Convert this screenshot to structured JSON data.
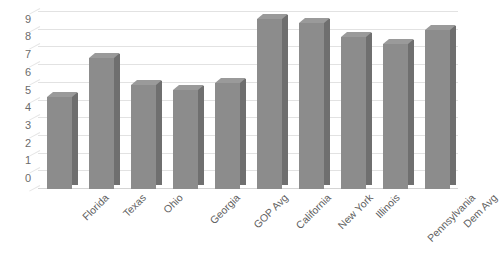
{
  "chart_data": {
    "type": "bar",
    "title": "",
    "subtitle": "",
    "xlabel": "",
    "ylabel": "",
    "categories": [
      "Florida",
      "Texas",
      "Ohio",
      "Georgia",
      "GOP Avg",
      "California",
      "New York",
      "Illinois",
      "Pennsylvania",
      "Dem Avg"
    ],
    "values": [
      5.2,
      7.4,
      5.9,
      5.6,
      6.0,
      9.6,
      9.4,
      8.6,
      8.2,
      9.0
    ],
    "ylim": [
      0,
      10
    ],
    "ytick_labels": [
      "0",
      "1",
      "2",
      "3",
      "4",
      "5",
      "6",
      "7",
      "8",
      "9"
    ],
    "ytick_values": [
      0,
      1,
      2,
      3,
      4,
      5,
      6,
      7,
      8,
      9
    ],
    "ytick_step": 1,
    "grid": true,
    "grid_axis": "y",
    "legend": false,
    "legend_position": "none",
    "annotations": [],
    "series": [
      {
        "name": "Series 1",
        "values": [
          5.2,
          7.4,
          5.9,
          5.6,
          6.0,
          9.6,
          9.4,
          8.6,
          8.2,
          9.0
        ]
      }
    ]
  },
  "style": {
    "bar_face_color": "#8c8c8c",
    "bar_side_color": "#6f6f6f",
    "bar_top_color": "#9a9a9a",
    "gridline_color": "#e2e2e2",
    "axis_color": "#d4d4d4",
    "tick_label_color": "#6b6b6b",
    "background_color": "#ffffff"
  }
}
